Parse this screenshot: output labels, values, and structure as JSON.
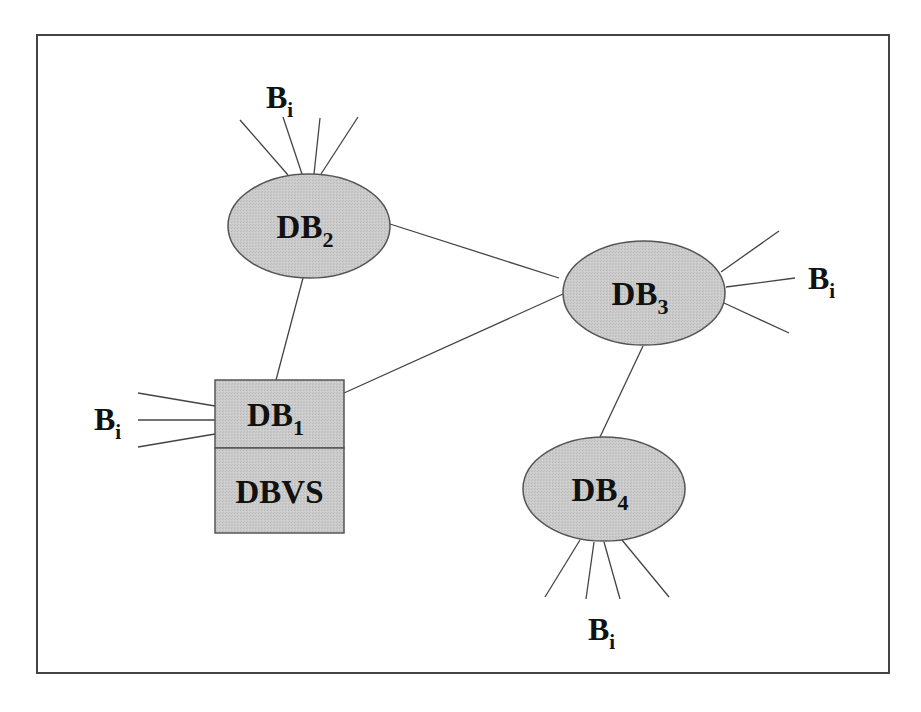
{
  "diagram": {
    "frame": {
      "x": 37,
      "y": 35,
      "width": 852,
      "height": 638,
      "stroke": "#444444"
    },
    "colors": {
      "node_fill": "#c9c9c9",
      "node_stroke": "#555555",
      "line": "#444444",
      "text": "#111111"
    },
    "nodes": [
      {
        "id": "DB2",
        "shape": "ellipse",
        "base": "DB",
        "sub": "2",
        "cx": 309,
        "cy": 226,
        "rx": 81,
        "ry": 52
      },
      {
        "id": "DB3",
        "shape": "ellipse",
        "base": "DB",
        "sub": "3",
        "cx": 644,
        "cy": 293,
        "rx": 81,
        "ry": 52
      },
      {
        "id": "DB4",
        "shape": "ellipse",
        "base": "DB",
        "sub": "4",
        "cx": 604,
        "cy": 489,
        "rx": 81,
        "ry": 52
      },
      {
        "id": "DB1",
        "shape": "rect",
        "base": "DB",
        "sub": "1",
        "x": 215,
        "y": 380,
        "width": 129,
        "height": 68
      },
      {
        "id": "DBVS",
        "shape": "rect",
        "base": "DBVS",
        "sub": "",
        "x": 215,
        "y": 448,
        "width": 129,
        "height": 85
      }
    ],
    "edges": [
      {
        "from": "DB2",
        "to": "DB1",
        "x1": 303,
        "y1": 278,
        "x2": 276,
        "y2": 380
      },
      {
        "from": "DB2",
        "to": "DB3",
        "x1": 390,
        "y1": 224,
        "x2": 559,
        "y2": 278
      },
      {
        "from": "DB1",
        "to": "DB3",
        "x1": 344,
        "y1": 393,
        "x2": 563,
        "y2": 294
      },
      {
        "from": "DB3",
        "to": "DB4",
        "x1": 643,
        "y1": 346,
        "x2": 600,
        "y2": 437
      }
    ],
    "branch_groups": [
      {
        "attached_to": "DB2",
        "label_base": "B",
        "label_sub": "i",
        "label_x": 266,
        "label_y": 108,
        "lines": [
          [
            240,
            120,
            288,
            175
          ],
          [
            283,
            117,
            302,
            174
          ],
          [
            320,
            118,
            314,
            174
          ],
          [
            358,
            117,
            321,
            174
          ]
        ]
      },
      {
        "attached_to": "DB1",
        "label_base": "B",
        "label_sub": "i",
        "label_x": 94,
        "label_y": 430,
        "lines": [
          [
            138,
            393,
            215,
            406
          ],
          [
            138,
            420,
            215,
            420
          ],
          [
            138,
            447,
            215,
            434
          ]
        ]
      },
      {
        "attached_to": "DB3",
        "label_base": "B",
        "label_sub": "i",
        "label_x": 808,
        "label_y": 289,
        "lines": [
          [
            721,
            272,
            779,
            231
          ],
          [
            726,
            287,
            795,
            278
          ],
          [
            724,
            303,
            789,
            333
          ]
        ]
      },
      {
        "attached_to": "DB4",
        "label_base": "B",
        "label_sub": "i",
        "label_x": 588,
        "label_y": 640,
        "lines": [
          [
            580,
            540,
            545,
            597
          ],
          [
            594,
            542,
            586,
            599
          ],
          [
            604,
            542,
            620,
            599
          ],
          [
            622,
            540,
            669,
            597
          ]
        ]
      }
    ]
  }
}
